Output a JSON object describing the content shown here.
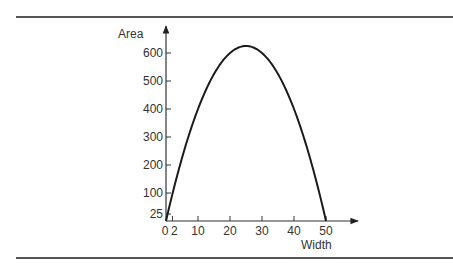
{
  "chart_data": {
    "type": "line",
    "title": "",
    "xlabel": "Width",
    "ylabel": "Area",
    "x_ticks": [
      0,
      2,
      10,
      20,
      30,
      40,
      50
    ],
    "x_tick_labels": [
      "0",
      "2",
      "10",
      "20",
      "30",
      "40",
      "50"
    ],
    "y_ticks": [
      25,
      100,
      200,
      300,
      400,
      500,
      600
    ],
    "y_tick_labels": [
      "25",
      "100",
      "200",
      "300",
      "400",
      "500",
      "600"
    ],
    "xlim": [
      0,
      55
    ],
    "ylim": [
      0,
      650
    ],
    "grid": false,
    "legend": null,
    "series": [
      {
        "name": "Area = Width × (50 − Width)",
        "x": [
          0,
          2,
          5,
          10,
          15,
          20,
          25,
          30,
          35,
          40,
          45,
          48,
          50
        ],
        "y": [
          0,
          96,
          225,
          400,
          525,
          600,
          625,
          600,
          525,
          400,
          225,
          96,
          0
        ]
      }
    ]
  },
  "labels": {
    "y_axis": "Area",
    "x_axis": "Width"
  },
  "colors": {
    "curve": "#1a1a1a",
    "axis": "#333333",
    "rule": "#555555"
  }
}
